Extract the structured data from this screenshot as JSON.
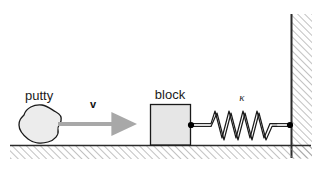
{
  "figure": {
    "title": "",
    "background_color": "#ffffff",
    "width": 328,
    "height": 171
  },
  "labels": {
    "putty": "putty",
    "block": "block",
    "velocity": "v",
    "spring_constant": "κ"
  },
  "colors": {
    "outline": "#1a1a1a",
    "body_fill": "#e6e6e6",
    "putty_fill": "#ececec",
    "arrow": "#a8a8a8",
    "hatch": "#8c8c8c",
    "ground_line": "#2b2b2b",
    "wall_line": "#2b2b2b",
    "spring": "#1a1a1a",
    "node_dot": "#000000"
  },
  "objects": {
    "putty": {
      "name": "putty",
      "shape": "irregular-blob",
      "center_x": 40,
      "center_y": 124,
      "radius_x": 22,
      "radius_y": 18
    },
    "block": {
      "name": "block",
      "shape": "square",
      "x": 150,
      "y": 104,
      "width": 41,
      "height": 41
    },
    "spring": {
      "name": "spring",
      "label": "κ",
      "left_x": 190,
      "right_x": 291,
      "center_y": 125,
      "coil_count": 6,
      "amplitude": 14
    },
    "velocity_arrow": {
      "name": "velocity",
      "label": "v",
      "start_x": 57,
      "end_x": 121,
      "y": 124,
      "direction": "right"
    },
    "ground": {
      "name": "ground",
      "line_y": 145,
      "left_x": 10,
      "right_x": 311,
      "hatch_depth": 13
    },
    "wall": {
      "name": "wall",
      "line_x": 291,
      "top_y": 14,
      "bottom_y": 158,
      "hatch_width": 20
    }
  }
}
